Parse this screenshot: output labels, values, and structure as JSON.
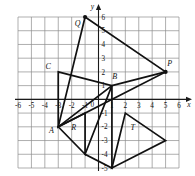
{
  "figure": {
    "kind": "coordinate-plane-graph",
    "background_color": "#ffffff",
    "grid_color": "#8d8d8d",
    "axis_color": "#1a1a1a",
    "shape_color": "#111111"
  },
  "axes": {
    "x_axis_name": "x",
    "y_axis_name": "y",
    "x_min": -6,
    "x_max": 6,
    "y_min": -5,
    "y_max": 6,
    "x_tick_labels": [
      "-6",
      "-5",
      "-4",
      "-3",
      "-2",
      "-1",
      "0",
      "1",
      "2",
      "3",
      "4",
      "5",
      "6"
    ],
    "y_tick_labels": [
      "6",
      "5",
      "4",
      "3",
      "2",
      "1",
      "-1",
      "-2",
      "-3",
      "-4",
      "-5"
    ],
    "origin_label": "0",
    "grid_visible": true
  },
  "chart_data": {
    "type": "scatter",
    "title": "",
    "xlabel": "x",
    "ylabel": "y",
    "xlim": [
      -6,
      6
    ],
    "ylim": [
      -5,
      6
    ],
    "grid": true,
    "shapes": [
      {
        "name": "triangle-Q",
        "label": "Q",
        "label_point": [
          -1.55,
          5.35
        ],
        "vertices": [
          [
            -1,
            6
          ],
          [
            5,
            2
          ],
          [
            -3,
            -2
          ]
        ]
      },
      {
        "name": "triangle-C",
        "label": "C",
        "label_point": [
          -3.75,
          2.2
        ],
        "vertices": [
          [
            -3,
            2
          ],
          [
            1,
            1
          ],
          [
            -3,
            -2
          ]
        ]
      },
      {
        "name": "triangle-R",
        "label": "R",
        "label_point": [
          -1.85,
          -2.25
        ],
        "vertices": [
          [
            -3,
            -2
          ],
          [
            -1,
            -1
          ],
          [
            -1,
            -4
          ]
        ]
      },
      {
        "name": "triangle-B",
        "label": "B",
        "label_point": [
          1.2,
          1.45
        ],
        "vertices": [
          [
            1,
            1
          ],
          [
            -1,
            -4
          ],
          [
            1,
            -5
          ]
        ]
      },
      {
        "name": "triangle-T",
        "label": "T",
        "label_point": [
          2.55,
          -2.25
        ],
        "vertices": [
          [
            2,
            -1
          ],
          [
            5,
            -3
          ],
          [
            1,
            -5
          ]
        ]
      },
      {
        "name": "segment-P",
        "label": "P",
        "label_point": [
          5.3,
          2.45
        ],
        "vertices": [
          [
            5,
            2
          ],
          [
            1,
            1
          ]
        ]
      }
    ],
    "marked_points": [
      {
        "label": "Q",
        "x": -1,
        "y": 6
      },
      {
        "label": "C",
        "x": -3,
        "y": 2
      },
      {
        "label": "P",
        "x": 5,
        "y": 2
      },
      {
        "label": "B",
        "x": 1,
        "y": 1
      },
      {
        "label": "A",
        "x": -3,
        "y": -2
      },
      {
        "label": "R",
        "x": -1,
        "y": -1
      },
      {
        "label": "T",
        "x": 2,
        "y": -1
      }
    ],
    "point_labels": [
      {
        "text": "Q",
        "x": -1.55,
        "y": 5.35
      },
      {
        "text": "C",
        "x": -3.75,
        "y": 2.2
      },
      {
        "text": "P",
        "x": 5.3,
        "y": 2.45
      },
      {
        "text": "B",
        "x": 1.2,
        "y": 1.45
      },
      {
        "text": "A",
        "x": -3.5,
        "y": -2.45
      },
      {
        "text": "R",
        "x": -1.85,
        "y": -2.25
      },
      {
        "text": "T",
        "x": 2.55,
        "y": -2.25
      }
    ]
  }
}
